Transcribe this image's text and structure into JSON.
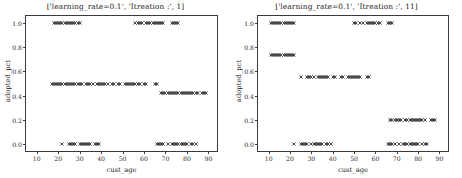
{
  "figure": {
    "background": "#ffffff",
    "marker_color": "#333333",
    "axis_color": "#3a3a3a"
  },
  "chart_data": [
    {
      "type": "scatter",
      "panel": "left",
      "title": "['learning_rate=0.1', 'Itreation :', 1]",
      "xlabel": "cust_age",
      "ylabel": "adopted_pct",
      "xlim": [
        5,
        94
      ],
      "ylim": [
        -0.06,
        1.06
      ],
      "grid": false,
      "legend": null,
      "xticks": [
        10,
        20,
        30,
        40,
        50,
        60,
        70,
        80,
        90
      ],
      "xtick_labels": [
        "10",
        "20",
        "30",
        "40",
        "50",
        "60",
        "70",
        "80",
        "90"
      ],
      "yticks": [
        0.0,
        0.2,
        0.4,
        0.6,
        0.8,
        1.0
      ],
      "ytick_labels": [
        "0.0",
        "0.2",
        "0.4",
        "0.6",
        "0.8",
        "1.0"
      ],
      "marker": "x",
      "series": [
        {
          "name": "adopted_pct",
          "x": [
            18,
            19,
            20,
            21,
            22,
            23,
            24,
            25,
            26,
            27,
            28,
            29,
            30,
            56,
            57,
            58,
            59,
            61,
            62,
            63,
            64,
            65,
            66,
            67,
            68,
            69,
            73,
            74,
            75,
            76
          ],
          "y": [
            1.0,
            1.0,
            1.0,
            1.0,
            1.0,
            1.0,
            1.0,
            1.0,
            1.0,
            1.0,
            1.0,
            1.0,
            1.0,
            1.0,
            1.0,
            1.0,
            1.0,
            1.0,
            1.0,
            1.0,
            1.0,
            1.0,
            1.0,
            1.0,
            1.0,
            1.0,
            1.0,
            1.0,
            1.0,
            1.0
          ]
        },
        {
          "name": "adopted_pct_mid",
          "x": [
            17,
            18,
            19,
            20,
            21,
            22,
            23,
            24,
            25,
            26,
            27,
            28,
            29,
            30,
            31,
            33,
            34,
            35,
            36,
            38,
            39,
            40,
            41,
            42,
            43,
            45,
            46,
            48,
            49,
            51,
            52,
            53,
            54,
            55,
            56,
            57,
            58,
            60,
            61,
            65,
            66
          ],
          "y": [
            0.5,
            0.5,
            0.5,
            0.5,
            0.5,
            0.5,
            0.5,
            0.5,
            0.5,
            0.5,
            0.5,
            0.5,
            0.5,
            0.5,
            0.5,
            0.5,
            0.5,
            0.5,
            0.5,
            0.5,
            0.5,
            0.5,
            0.5,
            0.5,
            0.5,
            0.5,
            0.5,
            0.5,
            0.5,
            0.5,
            0.5,
            0.5,
            0.5,
            0.5,
            0.5,
            0.5,
            0.5,
            0.5,
            0.5,
            0.5,
            0.5
          ]
        },
        {
          "name": "adopted_pct_low_band",
          "x": [
            68,
            69,
            70,
            71,
            72,
            73,
            74,
            75,
            76,
            77,
            78,
            79,
            80,
            81,
            82,
            83,
            84,
            85,
            87,
            88,
            89
          ],
          "y": [
            0.42,
            0.42,
            0.42,
            0.42,
            0.42,
            0.42,
            0.42,
            0.42,
            0.42,
            0.42,
            0.42,
            0.42,
            0.42,
            0.42,
            0.42,
            0.42,
            0.42,
            0.42,
            0.42,
            0.42,
            0.42
          ]
        },
        {
          "name": "adopted_pct_zero",
          "x": [
            22,
            25,
            26,
            27,
            28,
            30,
            31,
            32,
            33,
            34,
            35,
            37,
            38,
            39,
            66,
            67,
            68,
            69,
            71,
            73,
            74,
            75,
            76,
            77,
            78,
            79,
            80,
            82,
            83,
            84
          ],
          "y": [
            0.0,
            0.0,
            0.0,
            0.0,
            0.0,
            0.0,
            0.0,
            0.0,
            0.0,
            0.0,
            0.0,
            0.0,
            0.0,
            0.0,
            0.0,
            0.0,
            0.0,
            0.0,
            0.0,
            0.0,
            0.0,
            0.0,
            0.0,
            0.0,
            0.0,
            0.0,
            0.0,
            0.0,
            0.0,
            0.0
          ]
        }
      ]
    },
    {
      "type": "scatter",
      "panel": "right",
      "title": "['learning_rate=0.1', 'Itreation :', 11]",
      "xlabel": "cust_age",
      "ylabel": "adopted_pct",
      "xlim": [
        5,
        94
      ],
      "ylim": [
        -0.06,
        1.06
      ],
      "grid": false,
      "legend": null,
      "xticks": [
        10,
        20,
        30,
        40,
        50,
        60,
        70,
        80,
        90
      ],
      "xtick_labels": [
        "10",
        "20",
        "30",
        "40",
        "50",
        "60",
        "70",
        "80",
        "90"
      ],
      "yticks": [
        0.0,
        0.2,
        0.4,
        0.6,
        0.8,
        1.0
      ],
      "ytick_labels": [
        "0.0",
        "0.2",
        "0.4",
        "0.6",
        "0.8",
        "1.0"
      ],
      "marker": "x",
      "series": [
        {
          "name": "adopted_pct_top",
          "x": [
            11,
            12,
            13,
            14,
            15,
            16,
            17,
            18,
            19,
            20,
            21,
            22,
            50,
            51,
            53,
            54,
            56,
            57,
            58,
            59,
            60,
            61,
            62,
            66,
            67,
            68
          ],
          "y": [
            1.0,
            1.0,
            1.0,
            1.0,
            1.0,
            1.0,
            1.0,
            1.0,
            1.0,
            1.0,
            1.0,
            1.0,
            1.0,
            1.0,
            1.0,
            1.0,
            1.0,
            1.0,
            1.0,
            1.0,
            1.0,
            1.0,
            1.0,
            1.0,
            1.0,
            1.0
          ]
        },
        {
          "name": "adopted_pct_074",
          "x": [
            11,
            12,
            13,
            14,
            15,
            16,
            17,
            18,
            19,
            20,
            21,
            22
          ],
          "y": [
            0.74,
            0.74,
            0.74,
            0.74,
            0.74,
            0.74,
            0.74,
            0.74,
            0.74,
            0.74,
            0.74,
            0.74
          ]
        },
        {
          "name": "adopted_pct_055",
          "x": [
            25,
            28,
            29,
            30,
            31,
            33,
            34,
            35,
            36,
            37,
            38,
            40,
            41,
            44,
            45,
            47,
            48,
            49,
            50,
            51,
            52,
            53,
            56,
            57
          ],
          "y": [
            0.55,
            0.55,
            0.55,
            0.55,
            0.55,
            0.55,
            0.55,
            0.55,
            0.55,
            0.55,
            0.55,
            0.55,
            0.55,
            0.55,
            0.55,
            0.55,
            0.55,
            0.55,
            0.55,
            0.55,
            0.55,
            0.55,
            0.55,
            0.55
          ]
        },
        {
          "name": "adopted_pct_020",
          "x": [
            67,
            68,
            69,
            70,
            71,
            72,
            74,
            75,
            76,
            77,
            78,
            79,
            80,
            81,
            82,
            83,
            86,
            87,
            88
          ],
          "y": [
            0.2,
            0.2,
            0.2,
            0.2,
            0.2,
            0.2,
            0.2,
            0.2,
            0.2,
            0.2,
            0.2,
            0.2,
            0.2,
            0.2,
            0.2,
            0.2,
            0.2,
            0.2,
            0.2
          ]
        },
        {
          "name": "adopted_pct_zero",
          "x": [
            22,
            25,
            26,
            27,
            28,
            30,
            31,
            32,
            33,
            34,
            35,
            37,
            38,
            39,
            66,
            67,
            68,
            69,
            71,
            73,
            74,
            75,
            76,
            77,
            78,
            79,
            80,
            82,
            83,
            84
          ],
          "y": [
            0.0,
            0.0,
            0.0,
            0.0,
            0.0,
            0.0,
            0.0,
            0.0,
            0.0,
            0.0,
            0.0,
            0.0,
            0.0,
            0.0,
            0.0,
            0.0,
            0.0,
            0.0,
            0.0,
            0.0,
            0.0,
            0.0,
            0.0,
            0.0,
            0.0,
            0.0,
            0.0,
            0.0,
            0.0,
            0.0
          ]
        }
      ]
    }
  ]
}
